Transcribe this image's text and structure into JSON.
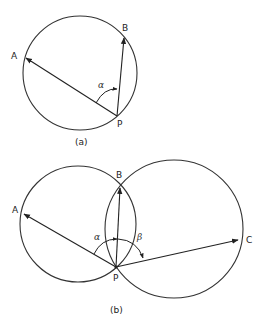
{
  "figure_a": {
    "caption": "(a)",
    "labels": {
      "A": "A",
      "B": "B",
      "P": "P"
    },
    "angle_label": "α",
    "circle": {
      "cx": 80,
      "cy": 73,
      "r": 57
    },
    "points": {
      "P": [
        117,
        116
      ],
      "A": [
        25,
        58
      ],
      "B": [
        124,
        37
      ]
    }
  },
  "figure_b": {
    "caption": "(b)",
    "labels": {
      "A": "A",
      "B": "B",
      "C": "C",
      "P": "P"
    },
    "angle_labels": {
      "alpha": "α",
      "beta": "β"
    },
    "circles": [
      {
        "cx": 78,
        "cy": 224,
        "r": 58
      },
      {
        "cx": 174,
        "cy": 229,
        "r": 69
      }
    ],
    "points": {
      "P": [
        116,
        267
      ],
      "A": [
        23,
        214
      ],
      "B": [
        120,
        186
      ],
      "C": [
        239,
        240
      ]
    }
  },
  "colors": {
    "stroke": "#333333",
    "background": "#ffffff"
  }
}
